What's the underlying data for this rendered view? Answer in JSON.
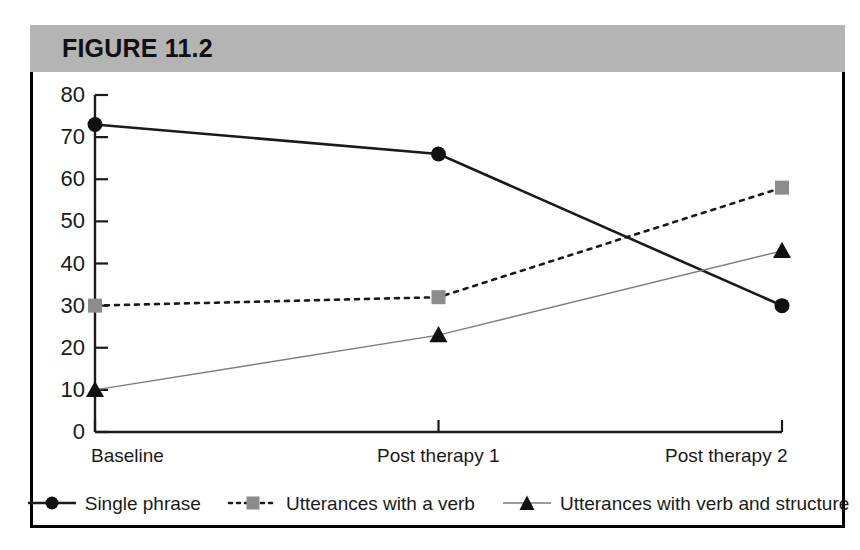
{
  "figure": {
    "title": "FIGURE 11.2",
    "band_color": "#b4b4b4",
    "frame_color": "#000000"
  },
  "chart_data": {
    "type": "line",
    "title": "FIGURE 11.2",
    "xlabel": "",
    "ylabel": "",
    "categories": [
      "Baseline",
      "Post therapy 1",
      "Post therapy 2"
    ],
    "ylim": [
      0,
      80
    ],
    "yticks": [
      0,
      10,
      20,
      30,
      40,
      50,
      60,
      70,
      80
    ],
    "ytick_labels": [
      "0",
      "10",
      "20",
      "30",
      "40",
      "50",
      "60",
      "70",
      "80"
    ],
    "grid": false,
    "legend_position": "bottom",
    "series": [
      {
        "name": "Single phrase",
        "values": [
          73,
          66,
          30
        ],
        "marker": "circle",
        "marker_color": "#111111",
        "line_style": "solid",
        "line_color": "#1a1a1a",
        "line_width": 2.6
      },
      {
        "name": "Utterances with a verb",
        "values": [
          30,
          32,
          58
        ],
        "marker": "square",
        "marker_color": "#8c8c8c",
        "line_style": "dotted",
        "line_color": "#1a1a1a",
        "line_width": 2.6
      },
      {
        "name": "Utterances with verb and structure",
        "values": [
          10,
          23,
          43
        ],
        "marker": "triangle",
        "marker_color": "#111111",
        "line_style": "solid",
        "line_color": "#7d7d7d",
        "line_width": 1.4
      }
    ]
  },
  "legend": {
    "items": [
      {
        "label": "Single phrase"
      },
      {
        "label": "Utterances with a verb"
      },
      {
        "label": "Utterances with verb and structure"
      }
    ]
  }
}
